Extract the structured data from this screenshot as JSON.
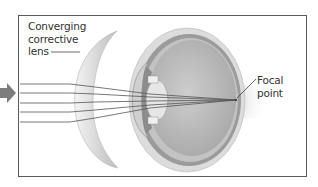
{
  "diagram": {
    "labels": {
      "lens": [
        "Converging",
        "corrective",
        "lens"
      ],
      "focal": [
        "Focal",
        "point"
      ]
    },
    "rays": {
      "count": 5,
      "start_y": [
        84,
        93,
        103,
        112,
        122
      ]
    },
    "colors": {
      "frame": "#5a5a5a",
      "arrow": "#7a7a7a",
      "ray": "#555555",
      "lens_fill": "#e2e2e2",
      "sclera": "#d8d8d8",
      "choroid": "#9a9a9a",
      "vitreous": "#bdbdbd",
      "text": "#333333"
    }
  }
}
